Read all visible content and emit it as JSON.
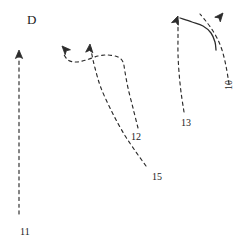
{
  "figure": {
    "panel_label": "D",
    "panel_label_x": 27,
    "panel_label_y": 12,
    "panel_label_size": 13,
    "width": 249,
    "height": 246,
    "background_color": "#ffffff",
    "stroke_color": "#2b2b2b",
    "label_color": "#1a1a1a"
  },
  "chart_data": {
    "type": "line",
    "title": "D",
    "xlabel": "",
    "ylabel": "",
    "grid": false,
    "legend": "none",
    "xlim": [
      0,
      249
    ],
    "ylim": [
      246,
      0
    ],
    "note": "Hand-drawn trajectory/track diagram: five numbered dashed paths with solid arrowheads, plus one short solid curve in the upper right.",
    "series": [
      {
        "name": "11",
        "style": "dashed",
        "label": "11",
        "label_x": 20,
        "label_y": 226,
        "label_rotation": 0,
        "label_size": 10,
        "arrow_at": "start",
        "points": [
          [
            19,
            214
          ],
          [
            19,
            180
          ],
          [
            19,
            140
          ],
          [
            19,
            100
          ],
          [
            19,
            70
          ],
          [
            19,
            53
          ]
        ]
      },
      {
        "name": "15",
        "style": "dashed",
        "label": "15",
        "label_x": 152,
        "label_y": 171,
        "label_rotation": 0,
        "label_size": 10,
        "arrow_at": "start",
        "points": [
          [
            146,
            166
          ],
          [
            136,
            152
          ],
          [
            124,
            134
          ],
          [
            112,
            112
          ],
          [
            101,
            88
          ],
          [
            95,
            68
          ],
          [
            92,
            55
          ],
          [
            91,
            48
          ]
        ]
      },
      {
        "name": "12",
        "style": "dashed",
        "label": "12",
        "label_x": 131,
        "label_y": 131,
        "label_rotation": 0,
        "label_size": 10,
        "arrow_at": "start",
        "points": [
          [
            138,
            128
          ],
          [
            133,
            108
          ],
          [
            128,
            88
          ],
          [
            125,
            72
          ],
          [
            123,
            62
          ],
          [
            118,
            57
          ],
          [
            108,
            55
          ],
          [
            98,
            56
          ],
          [
            86,
            60
          ],
          [
            76,
            62
          ],
          [
            68,
            60
          ],
          [
            63,
            53
          ]
        ]
      },
      {
        "name": "13",
        "style": "dashed",
        "label": "13",
        "label_x": 181,
        "label_y": 117,
        "label_rotation": 0,
        "label_size": 10,
        "arrow_at": "start",
        "points": [
          [
            184,
            112
          ],
          [
            181,
            92
          ],
          [
            179,
            72
          ],
          [
            178,
            54
          ],
          [
            178,
            38
          ],
          [
            178,
            26
          ],
          [
            178,
            20
          ]
        ]
      },
      {
        "name": "10",
        "style": "dashed",
        "label": "10",
        "label_x": 223,
        "label_y": 90,
        "label_rotation": -90,
        "label_size": 10,
        "arrow_at": "start",
        "points": [
          [
            229,
            84
          ],
          [
            226,
            66
          ],
          [
            222,
            50
          ],
          [
            217,
            38
          ],
          [
            211,
            28
          ],
          [
            205,
            20
          ],
          [
            200,
            14
          ]
        ]
      }
    ],
    "solid_curves": [
      {
        "name": "solid-hook-curve",
        "style": "solid",
        "points": [
          [
            180,
            18
          ],
          [
            192,
            22
          ],
          [
            203,
            26
          ],
          [
            211,
            33
          ],
          [
            215,
            42
          ],
          [
            216,
            50
          ]
        ]
      }
    ],
    "arrowheads": [
      {
        "name": "arrowhead-11",
        "x": 19,
        "y": 50,
        "angle": -90
      },
      {
        "name": "arrowhead-12",
        "x": 62,
        "y": 46,
        "angle": -133
      },
      {
        "name": "arrowhead-15",
        "x": 90,
        "y": 44,
        "angle": -85
      },
      {
        "name": "arrowhead-13",
        "x": 178,
        "y": 16,
        "angle": -69
      },
      {
        "name": "arrowhead-10",
        "x": 223,
        "y": 13,
        "angle": -50
      }
    ]
  }
}
